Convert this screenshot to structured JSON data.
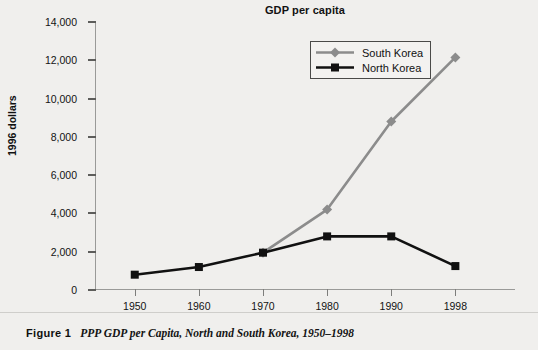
{
  "chart": {
    "title": "GDP per capita",
    "y_axis_title": "1996 dollars"
  },
  "legend": {
    "items": [
      {
        "label": "South Korea",
        "color": "#8c8c8c",
        "marker": "diamond"
      },
      {
        "label": "North Korea",
        "color": "#111111",
        "marker": "square"
      }
    ]
  },
  "caption": {
    "figure_label": "Figure 1",
    "text": "PPP GDP per Capita, North and South Korea, 1950–1998"
  },
  "chart_data": {
    "type": "line",
    "title": "GDP per capita",
    "xlabel": "",
    "ylabel": "1996 dollars",
    "categories": [
      "1950",
      "1960",
      "1970",
      "1980",
      "1990",
      "1998"
    ],
    "ylim": [
      0,
      14000
    ],
    "yticks": [
      0,
      2000,
      4000,
      6000,
      8000,
      10000,
      12000,
      14000
    ],
    "ytick_labels": [
      "0",
      "2,000",
      "4,000",
      "6,000",
      "8,000",
      "10,000",
      "12,000",
      "14,000"
    ],
    "grid": false,
    "legend_position": "upper-center-right",
    "series": [
      {
        "name": "South Korea",
        "color": "#8c8c8c",
        "marker": "diamond",
        "values": [
          null,
          null,
          1950,
          4200,
          8800,
          12150
        ]
      },
      {
        "name": "North Korea",
        "color": "#111111",
        "marker": "square",
        "values": [
          800,
          1200,
          1950,
          2800,
          2800,
          1250
        ]
      }
    ]
  }
}
